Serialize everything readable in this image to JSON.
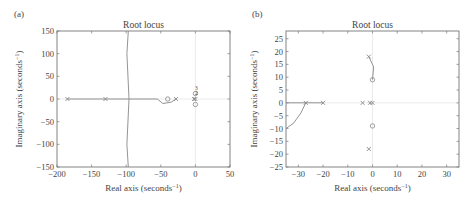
{
  "chart_data": [
    {
      "panel": "(a)",
      "type": "scatter",
      "title": "Root locus",
      "xlabel": "Real axis (seconds",
      "xlabel_sup": "−1",
      "ylabel": "Imaginary axis (seconds",
      "ylabel_sup": "−1",
      "xlim": [
        -200,
        50
      ],
      "ylim": [
        -150,
        150
      ],
      "xticks": [
        "−200",
        "−150",
        "−100",
        "−50",
        "0",
        "50"
      ],
      "xtick_values": [
        -200,
        -150,
        -100,
        -50,
        0,
        50
      ],
      "yticks": [
        "150",
        "100",
        "50",
        "0",
        "−50",
        "−100",
        "−150"
      ],
      "ytick_values": [
        150,
        100,
        50,
        0,
        -50,
        -100,
        -150
      ],
      "grid": false,
      "series": [
        {
          "name": "real-axis locus",
          "points": [
            [
              -185,
              0
            ],
            [
              -130,
              0
            ],
            [
              -97,
              0
            ],
            [
              -55,
              0
            ]
          ]
        },
        {
          "name": "asymptote branch",
          "points": [
            [
              -97,
              150
            ],
            [
              -99,
              100
            ],
            [
              -96,
              0
            ],
            [
              -99,
              -100
            ],
            [
              -97,
              -150
            ]
          ]
        },
        {
          "name": "loop branch",
          "points": [
            [
              -55,
              0
            ],
            [
              -47,
              -10
            ],
            [
              -35,
              -7
            ],
            [
              -28,
              0
            ]
          ]
        }
      ],
      "poles": [
        [
          -185,
          0
        ],
        [
          -130,
          0
        ],
        [
          -28,
          0
        ],
        [
          0,
          0
        ],
        [
          -2,
          0
        ]
      ],
      "zeros": [
        [
          -40,
          0
        ],
        [
          0,
          12
        ],
        [
          0,
          -12
        ]
      ],
      "annotations": [
        "3",
        "2"
      ]
    },
    {
      "panel": "(b)",
      "type": "scatter",
      "title": "Root locus",
      "xlabel": "Real axis (seconds",
      "xlabel_sup": "−1",
      "ylabel": "Imaginary axis (seconds",
      "ylabel_sup": "−1",
      "xlim": [
        -35,
        35
      ],
      "ylim": [
        -25,
        28
      ],
      "xticks": [
        "−30",
        "−20",
        "−10",
        "0",
        "10",
        "20",
        "30"
      ],
      "xtick_values": [
        -30,
        -20,
        -10,
        0,
        10,
        20,
        30
      ],
      "yticks": [
        "25",
        "20",
        "15",
        "10",
        "5",
        "0",
        "−5",
        "−10",
        "−15",
        "−20",
        "−25"
      ],
      "ytick_values": [
        25,
        20,
        15,
        10,
        5,
        0,
        -5,
        -10,
        -15,
        -20,
        -25
      ],
      "grid": false,
      "series": [
        {
          "name": "real-axis locus",
          "points": [
            [
              -35,
              0
            ],
            [
              -27,
              0
            ],
            [
              -20,
              0
            ]
          ]
        },
        {
          "name": "lower branch",
          "points": [
            [
              -27,
              0
            ],
            [
              -29,
              -4
            ],
            [
              -32,
              -8
            ],
            [
              -35,
              -10
            ]
          ]
        },
        {
          "name": "upper branch",
          "points": [
            [
              -1.5,
              18
            ],
            [
              0.5,
              14
            ],
            [
              0,
              9
            ]
          ]
        }
      ],
      "poles": [
        [
          -27,
          0
        ],
        [
          -20,
          0
        ],
        [
          -4,
          0
        ],
        [
          -1,
          0
        ],
        [
          0,
          0
        ],
        [
          -1.5,
          18
        ],
        [
          -1.5,
          -18
        ]
      ],
      "zeros": [
        [
          0,
          9
        ],
        [
          0,
          -9
        ]
      ]
    }
  ],
  "panels": {
    "a": {
      "tag": "(a)",
      "title": "Root locus"
    },
    "b": {
      "tag": "(b)",
      "title": "Root locus"
    }
  },
  "colors": {
    "axis": "#777777",
    "locus": "#888888",
    "light": "#c8c8c8",
    "text": "#444444"
  }
}
